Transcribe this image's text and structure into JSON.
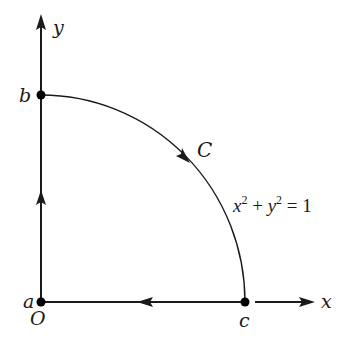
{
  "diagram": {
    "title": "",
    "axes": {
      "x_label": "x",
      "y_label": "y",
      "origin_label": "O"
    },
    "points": [
      {
        "id": "a",
        "label": "a",
        "coords": [
          0,
          0
        ]
      },
      {
        "id": "b",
        "label": "b",
        "coords": [
          0,
          1
        ]
      },
      {
        "id": "c",
        "label": "c",
        "coords": [
          1,
          0
        ]
      }
    ],
    "curve": {
      "label": "C",
      "equation": {
        "x": "x",
        "x_exp": "2",
        "plus": " + ",
        "y": "y",
        "y_exp": "2",
        "equals": " = 1"
      }
    },
    "segments": [
      {
        "from": "a",
        "to": "b",
        "direction": "up"
      },
      {
        "from": "b",
        "to": "c",
        "type": "arc",
        "direction": "clockwise"
      },
      {
        "from": "c",
        "to": "a",
        "direction": "left"
      }
    ],
    "colors": {
      "stroke": "#1a1a1a",
      "background": "#ffffff"
    }
  }
}
